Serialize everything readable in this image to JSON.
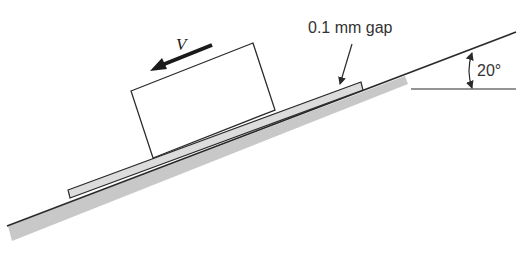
{
  "diagram": {
    "type": "block-sliding-on-inclined-plane",
    "labels": {
      "velocity": "V",
      "gap": "0.1 mm gap",
      "angle": "20°"
    },
    "incline_angle_deg": 20,
    "gap_thickness": "0.1 mm",
    "colors": {
      "line": "#2a2a2a",
      "ground_fill": "#c8c8c8",
      "plate_fill": "#dcdcdc",
      "block_fill": "#ffffff",
      "background": "#ffffff"
    }
  }
}
